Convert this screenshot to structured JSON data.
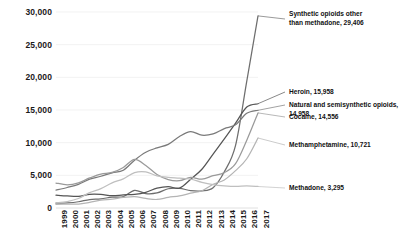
{
  "chart_data": {
    "type": "line",
    "title": "",
    "xlabel": "",
    "ylabel": "",
    "grid": true,
    "legend_position": "inline-right-annotations",
    "ylim": [
      0,
      30000
    ],
    "xlim": [
      1999,
      2017
    ],
    "y_ticks": [
      "0",
      "5,000",
      "10,000",
      "15,000",
      "20,000",
      "25,000",
      "30,000"
    ],
    "y_tick_values": [
      0,
      5000,
      10000,
      15000,
      20000,
      25000,
      30000
    ],
    "categories": [
      "1999",
      "2000",
      "2001",
      "2002",
      "2003",
      "2004",
      "2005",
      "2006",
      "2007",
      "2008",
      "2009",
      "2010",
      "2011",
      "2012",
      "2013",
      "2014",
      "2015",
      "2016",
      "2017"
    ],
    "x": [
      1999,
      2000,
      2001,
      2002,
      2003,
      2004,
      2005,
      2006,
      2007,
      2008,
      2009,
      2010,
      2011,
      2012,
      2013,
      2014,
      2015,
      2016,
      2017
    ],
    "series": [
      {
        "name": "Synthetic opioids other than methadone",
        "end_label": "Synthetic opioids other\nthan methadone, 29,406",
        "end_value": 29406,
        "color": "#6e6e6e",
        "values": [
          730,
          782,
          957,
          1295,
          1400,
          1664,
          1742,
          2707,
          2213,
          2306,
          2946,
          3007,
          2666,
          2628,
          3105,
          5544,
          9580,
          19413,
          29406
        ]
      },
      {
        "name": "Heroin",
        "end_label": "Heroin, 15,958",
        "end_value": 15958,
        "color": "#555555",
        "values": [
          1960,
          1842,
          1779,
          2089,
          2080,
          1878,
          2009,
          2088,
          2399,
          3041,
          3278,
          3036,
          4397,
          5925,
          8257,
          10574,
          12989,
          15469,
          15958
        ]
      },
      {
        "name": "Natural and semisynthetic opioids",
        "end_label": "Natural and semisynthetic opioids, 14,958",
        "end_value": 14958,
        "color": "#7a7a7a",
        "values": [
          2749,
          3137,
          3618,
          4416,
          4858,
          5377,
          5778,
          7323,
          8541,
          9202,
          9733,
          10943,
          11693,
          11140,
          11347,
          12159,
          12727,
          14487,
          14958
        ]
      },
      {
        "name": "Cocaine",
        "end_label": "Cocaine, 14,556",
        "end_value": 14556,
        "color": "#9a9a9a",
        "values": [
          3822,
          3544,
          3833,
          4599,
          5198,
          5443,
          6208,
          7448,
          6512,
          5129,
          4350,
          4183,
          4681,
          4404,
          4944,
          5415,
          6784,
          10375,
          14556
        ]
      },
      {
        "name": "Methamphetamine",
        "end_label": "Methamphetamine, 10,721",
        "end_value": 10721,
        "color": "#b4b4b4",
        "values": [
          547,
          592,
          607,
          872,
          1188,
          1371,
          1608,
          1756,
          1467,
          1304,
          1632,
          1854,
          2266,
          2635,
          3627,
          4298,
          5716,
          7542,
          10721
        ]
      },
      {
        "name": "Methadone",
        "end_label": "Methadone, 3,295",
        "end_value": 3295,
        "color": "#bfbfbf",
        "values": [
          784,
          988,
          1456,
          2360,
          2974,
          3849,
          4460,
          5406,
          5518,
          4924,
          4686,
          4577,
          4418,
          3932,
          3591,
          3400,
          3301,
          3373,
          3295
        ]
      }
    ]
  }
}
